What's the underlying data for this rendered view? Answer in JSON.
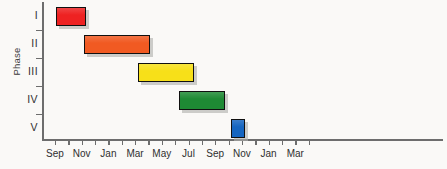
{
  "chart_data": {
    "type": "bar",
    "subtype": "gantt",
    "title": "",
    "xlabel": "",
    "ylabel": "Phase",
    "categories": [
      "I",
      "II",
      "III",
      "IV",
      "V"
    ],
    "x_tick_labels": [
      "Sep",
      "Nov",
      "Jan",
      "Mar",
      "May",
      "Jul",
      "Sep",
      "Nov",
      "Jan",
      "Mar"
    ],
    "x_tick_label_months": [
      0,
      2,
      4,
      6,
      8,
      10,
      12,
      14,
      16,
      18
    ],
    "x_minor_tick_months": [
      0,
      1,
      2,
      3,
      4,
      5,
      6,
      7,
      8,
      9,
      10,
      11,
      12,
      13,
      14,
      15,
      16,
      17,
      18,
      19
    ],
    "xlim_months": [
      -1,
      20
    ],
    "grid": false,
    "legend": false,
    "series": [
      {
        "name": "Phase I",
        "category": "I",
        "start_label": "Sep",
        "end_label": "Dec",
        "start_month": 0.1,
        "end_month": 4.6,
        "color": "#ee2222"
      },
      {
        "name": "Phase II",
        "category": "II",
        "start_label": "Dec",
        "end_label": "Jun",
        "start_month": 4.3,
        "end_month": 14.3,
        "color": "#f15a22"
      },
      {
        "name": "Phase III",
        "category": "III",
        "start_label": "May",
        "end_label": "Oct",
        "start_month": 12.5,
        "end_month": 20.8,
        "color": "#f7e019"
      },
      {
        "name": "Phase IV",
        "category": "IV",
        "start_label": "Sep",
        "end_label": "Feb",
        "start_month": 18.6,
        "end_month": 25.4,
        "color": "#1e8a34"
      },
      {
        "name": "Phase V",
        "category": "V",
        "start_label": "Feb",
        "end_label": "Mar",
        "start_month": 26.4,
        "end_month": 28.5,
        "color": "#1565c0"
      }
    ]
  },
  "axis": {
    "y_title": "Phase"
  },
  "geometry": {
    "plot_left": 42,
    "plot_right": 443,
    "plot_top": 2,
    "plot_bottom": 139,
    "band_height": 28,
    "bar_height": 19,
    "px_per_month": 13.35,
    "first_tick_x": 55
  }
}
